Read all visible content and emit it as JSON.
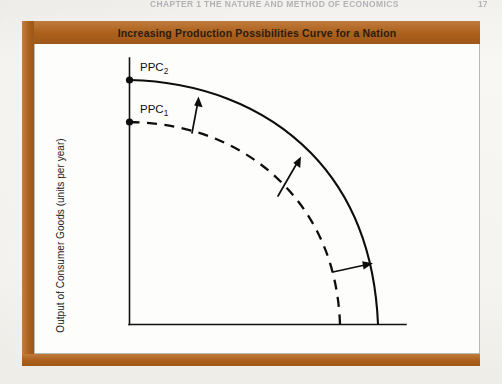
{
  "page": {
    "running_head": "CHAPTER 1  THE NATURE AND METHOD OF ECONOMICS",
    "running_head_page": "17",
    "background_color": "#f6f4f0"
  },
  "figure": {
    "frame_color": "#b5651d",
    "title": "Increasing Production Possibilities Curve for a Nation",
    "panel_color": "#fdfdfc"
  },
  "chart_data": {
    "type": "line",
    "title": "Increasing Production Possibilities Curve for a Nation",
    "xlabel": "Output of Military Goods (units per year)",
    "ylabel": "Output of Consumer Goods (units per year)",
    "grid": false,
    "legend": "inline-labels",
    "xlim": [
      0,
      100
    ],
    "ylim": [
      0,
      100
    ],
    "axis_ticks": [],
    "series": [
      {
        "name": "PPC1",
        "label": "PPC",
        "label_subscript": "1",
        "style": "dashed",
        "color": "#0d0d0d",
        "description": "Original production possibilities curve (inner, concave to origin)",
        "y_intercept": 72,
        "x_intercept": 76,
        "points": [
          {
            "x": 0,
            "y": 72
          },
          {
            "x": 12,
            "y": 71
          },
          {
            "x": 25,
            "y": 68
          },
          {
            "x": 38,
            "y": 62
          },
          {
            "x": 50,
            "y": 53
          },
          {
            "x": 60,
            "y": 43
          },
          {
            "x": 68,
            "y": 30
          },
          {
            "x": 73,
            "y": 16
          },
          {
            "x": 76,
            "y": 0
          }
        ],
        "endpoint_dot": true
      },
      {
        "name": "PPC2",
        "label": "PPC",
        "label_subscript": "2",
        "style": "solid",
        "color": "#0d0d0d",
        "description": "Expanded production possibilities curve (outer, shifted outward)",
        "y_intercept": 88,
        "x_intercept": 90,
        "points": [
          {
            "x": 0,
            "y": 88
          },
          {
            "x": 14,
            "y": 87
          },
          {
            "x": 29,
            "y": 84
          },
          {
            "x": 45,
            "y": 77
          },
          {
            "x": 59,
            "y": 67
          },
          {
            "x": 71,
            "y": 54
          },
          {
            "x": 81,
            "y": 37
          },
          {
            "x": 87,
            "y": 19
          },
          {
            "x": 90,
            "y": 0
          }
        ],
        "endpoint_dot": true
      }
    ],
    "annotations": [
      {
        "name": "shift-arrow-upper",
        "type": "arrow",
        "direction": "up",
        "from": {
          "x": 24,
          "y": 66
        },
        "to": {
          "x": 26,
          "y": 83
        },
        "meaning": "outward shift of the curve"
      },
      {
        "name": "shift-arrow-middle",
        "type": "arrow",
        "direction": "up-right",
        "from": {
          "x": 53,
          "y": 47
        },
        "to": {
          "x": 62,
          "y": 62
        },
        "meaning": "outward shift of the curve"
      },
      {
        "name": "shift-arrow-lower",
        "type": "arrow",
        "direction": "right",
        "from": {
          "x": 73,
          "y": 19
        },
        "to": {
          "x": 85,
          "y": 23
        },
        "meaning": "outward shift of the curve"
      }
    ]
  }
}
